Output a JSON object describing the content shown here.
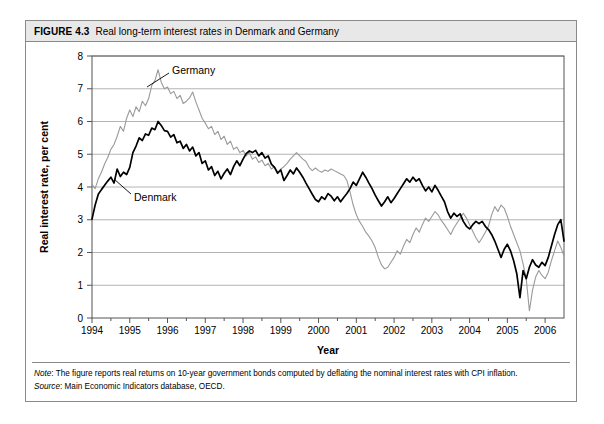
{
  "figure": {
    "number": "FIGURE 4.3",
    "title": "Real long-term interest rates in Denmark and Germany"
  },
  "notes": {
    "note_lead": "Note",
    "note_text": ": The figure reports real returns on 10-year government bonds computed by deflating the nominal interest rates with CPI inflation.",
    "source_lead": "Source",
    "source_text": ": Main Economic Indicators database, OECD."
  },
  "colors": {
    "denmark_line": "#000000",
    "germany_line": "#9a9a9a",
    "gridline": "#b4b4b4",
    "axis": "#555555",
    "title_bar": "#e8e8e8",
    "border": "#8a8a8a"
  },
  "chart_data": {
    "type": "line",
    "title": "Real long-term interest rates in Denmark and Germany",
    "xlabel": "Year",
    "ylabel": "Real interest rate, per cent",
    "xlim": [
      1994,
      2006.5
    ],
    "ylim": [
      0,
      8
    ],
    "yticks": [
      0,
      1,
      2,
      3,
      4,
      5,
      6,
      7,
      8
    ],
    "xticks": [
      1994,
      1995,
      1996,
      1997,
      1998,
      1999,
      2000,
      2001,
      2002,
      2003,
      2004,
      2005,
      2006
    ],
    "grid": true,
    "legend": "inline-annotations",
    "annotations": [
      {
        "text": "Germany",
        "series": "Germany",
        "x": 1995.25,
        "y": 7.05
      },
      {
        "text": "Denmark",
        "series": "Denmark",
        "x": 1994.55,
        "y": 3.72
      }
    ],
    "x_start": 1994.0,
    "x_step": 0.0833333,
    "series": [
      {
        "name": "Denmark",
        "values": [
          3.02,
          3.45,
          3.78,
          3.92,
          4.05,
          4.18,
          4.3,
          4.12,
          4.55,
          4.32,
          4.45,
          4.38,
          4.6,
          5.05,
          5.25,
          5.5,
          5.42,
          5.62,
          5.58,
          5.8,
          5.75,
          6.0,
          5.88,
          5.72,
          5.7,
          5.52,
          5.6,
          5.35,
          5.4,
          5.18,
          5.3,
          5.1,
          5.22,
          4.95,
          5.05,
          4.72,
          4.8,
          4.52,
          4.62,
          4.35,
          4.48,
          4.25,
          4.42,
          4.55,
          4.38,
          4.62,
          4.8,
          4.65,
          4.85,
          5.02,
          5.1,
          5.05,
          5.12,
          4.95,
          5.05,
          4.88,
          4.95,
          4.7,
          4.6,
          4.42,
          4.52,
          4.2,
          4.35,
          4.52,
          4.4,
          4.58,
          4.45,
          4.3,
          4.12,
          3.95,
          3.78,
          3.62,
          3.55,
          3.7,
          3.62,
          3.8,
          3.72,
          3.58,
          3.7,
          3.55,
          3.68,
          3.8,
          3.95,
          4.15,
          4.05,
          4.25,
          4.45,
          4.3,
          4.12,
          3.95,
          3.75,
          3.58,
          3.42,
          3.55,
          3.7,
          3.52,
          3.65,
          3.8,
          3.95,
          4.1,
          4.25,
          4.15,
          4.3,
          4.18,
          4.25,
          4.05,
          3.88,
          4.0,
          3.85,
          4.05,
          3.9,
          3.72,
          3.55,
          3.25,
          3.05,
          3.2,
          3.1,
          3.18,
          2.95,
          2.8,
          2.72,
          2.85,
          2.95,
          2.88,
          2.95,
          2.8,
          2.7,
          2.55,
          2.35,
          2.1,
          1.85,
          2.1,
          2.25,
          2.05,
          1.75,
          1.35,
          0.62,
          1.45,
          1.2,
          1.55,
          1.78,
          1.62,
          1.55,
          1.7,
          1.6,
          1.85,
          2.2,
          2.55,
          2.85,
          3.0,
          2.35
        ]
      },
      {
        "name": "Germany",
        "values": [
          4.08,
          3.95,
          4.25,
          4.45,
          4.7,
          4.9,
          5.15,
          5.3,
          5.55,
          5.85,
          5.7,
          6.1,
          6.35,
          6.15,
          6.45,
          6.3,
          6.62,
          6.48,
          6.7,
          7.1,
          7.25,
          7.58,
          7.2,
          7.0,
          7.05,
          6.85,
          6.92,
          6.7,
          6.8,
          6.55,
          6.62,
          6.72,
          6.9,
          6.6,
          6.35,
          6.1,
          5.95,
          5.78,
          5.85,
          5.6,
          5.7,
          5.45,
          5.55,
          5.3,
          5.4,
          5.15,
          5.22,
          5.05,
          5.12,
          4.95,
          5.05,
          4.85,
          4.92,
          4.75,
          4.82,
          4.65,
          4.72,
          4.55,
          4.62,
          4.45,
          4.55,
          4.62,
          4.72,
          4.85,
          4.95,
          5.05,
          4.95,
          4.85,
          4.78,
          4.6,
          4.5,
          4.58,
          4.5,
          4.45,
          4.52,
          4.48,
          4.55,
          4.5,
          4.45,
          4.4,
          4.35,
          4.2,
          3.85,
          3.45,
          3.15,
          2.95,
          2.8,
          2.62,
          2.5,
          2.35,
          2.15,
          1.85,
          1.62,
          1.5,
          1.55,
          1.7,
          1.85,
          2.05,
          1.95,
          2.2,
          2.4,
          2.3,
          2.55,
          2.75,
          2.62,
          2.85,
          3.05,
          2.95,
          3.1,
          3.25,
          3.15,
          2.98,
          2.85,
          2.7,
          2.55,
          2.75,
          2.9,
          3.05,
          3.2,
          3.05,
          2.85,
          2.65,
          2.45,
          2.3,
          2.45,
          2.62,
          2.8,
          3.15,
          3.4,
          3.25,
          3.45,
          3.35,
          3.1,
          2.8,
          2.55,
          2.3,
          2.05,
          1.65,
          1.2,
          0.22,
          0.85,
          1.25,
          1.45,
          1.3,
          1.2,
          1.4,
          1.75,
          2.05,
          2.35,
          2.15,
          1.9
        ]
      }
    ]
  }
}
